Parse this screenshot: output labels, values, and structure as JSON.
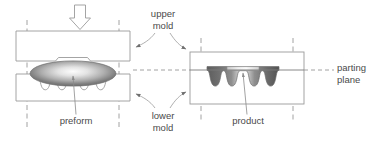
{
  "figure": {
    "background_color": "#ffffff",
    "line_color": "#9a9a9a",
    "dash_color": "#8c8c8c",
    "text_color": "#4a4a4a",
    "part_dark": "#5e5e5e",
    "part_light": "#f2f2f2"
  },
  "labels": {
    "upper_mold": {
      "line1": "upper",
      "line2": "mold"
    },
    "lower_mold": {
      "line1": "lower",
      "line2": "mold"
    },
    "parting_plane": {
      "line1": "parting",
      "line2": "plane"
    },
    "preform": "preform",
    "product": "product"
  },
  "icons": {
    "press_arrow": "down-arrow-icon",
    "leader_arrow": "arrowhead-icon"
  },
  "stages": [
    {
      "name": "open-mold-with-preform",
      "state": "open",
      "upper_mold": {
        "x": 16,
        "y": 31,
        "width": 114,
        "height": 30
      },
      "lower_mold": {
        "x": 16,
        "y": 74,
        "width": 114,
        "height": 27
      },
      "workpiece": "preform",
      "workpiece_shape": "ellipse"
    },
    {
      "name": "closed-mold-with-product",
      "state": "closed",
      "mold_block": {
        "x": 190,
        "y": 52,
        "width": 114,
        "height": 52
      },
      "workpiece": "product",
      "workpiece_shape": "gear-profile"
    }
  ],
  "geometry": {
    "parting_plane_y": 70,
    "cavity_valleys": 4,
    "press_direction": "down"
  }
}
